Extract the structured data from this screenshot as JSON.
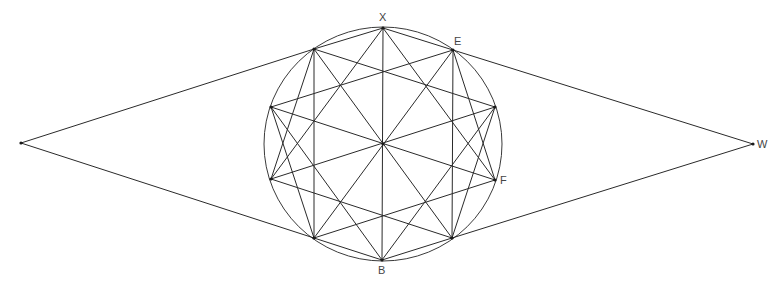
{
  "diagram": {
    "title": "",
    "colors": {
      "line": "#2a2a2a",
      "circle": "#3a3a3a",
      "label": "#444444",
      "background": "#ffffff"
    },
    "circle": {
      "cx": 383,
      "cy": 144,
      "rx": 119,
      "ry": 117
    },
    "points": {
      "X": {
        "x": 383,
        "y": 28,
        "label": "X"
      },
      "E": {
        "x": 453,
        "y": 50,
        "label": "E"
      },
      "RT": {
        "x": 495,
        "y": 107,
        "label": ""
      },
      "F": {
        "x": 495,
        "y": 180,
        "label": "F"
      },
      "LR": {
        "x": 452,
        "y": 238,
        "label": ""
      },
      "B": {
        "x": 382,
        "y": 260,
        "label": "B"
      },
      "LL": {
        "x": 314,
        "y": 238,
        "label": ""
      },
      "LB": {
        "x": 271,
        "y": 179,
        "label": ""
      },
      "LT": {
        "x": 271,
        "y": 107,
        "label": ""
      },
      "UL": {
        "x": 314,
        "y": 49,
        "label": ""
      },
      "C": {
        "x": 383,
        "y": 144,
        "label": ""
      },
      "L": {
        "x": 21,
        "y": 143,
        "label": ""
      },
      "W": {
        "x": 753,
        "y": 144,
        "label": "W"
      }
    },
    "labels": [
      {
        "text": "X",
        "x": 379,
        "y": 12
      },
      {
        "text": "E",
        "x": 454,
        "y": 36
      },
      {
        "text": "F",
        "x": 500,
        "y": 175
      },
      {
        "text": "B",
        "x": 378,
        "y": 265
      },
      {
        "text": "W",
        "x": 757,
        "y": 139
      }
    ],
    "segments": [
      [
        "L",
        "UL"
      ],
      [
        "L",
        "LL"
      ],
      [
        "W",
        "E"
      ],
      [
        "W",
        "LR"
      ],
      [
        "X",
        "B"
      ],
      [
        "UL",
        "LL"
      ],
      [
        "E",
        "LR"
      ],
      [
        "X",
        "UL"
      ],
      [
        "X",
        "E"
      ],
      [
        "B",
        "LL"
      ],
      [
        "B",
        "LR"
      ],
      [
        "X",
        "LB"
      ],
      [
        "X",
        "F"
      ],
      [
        "B",
        "LT"
      ],
      [
        "B",
        "RT"
      ],
      [
        "UL",
        "RT"
      ],
      [
        "LT",
        "E"
      ],
      [
        "LB",
        "LR"
      ],
      [
        "LL",
        "F"
      ],
      [
        "LT",
        "F"
      ],
      [
        "LB",
        "RT"
      ],
      [
        "UL",
        "LR"
      ],
      [
        "E",
        "LL"
      ],
      [
        "LT",
        "LL"
      ],
      [
        "LB",
        "UL"
      ],
      [
        "RT",
        "LR"
      ],
      [
        "F",
        "E"
      ]
    ],
    "vertices_marked": [
      "X",
      "E",
      "RT",
      "F",
      "LR",
      "B",
      "LL",
      "LB",
      "LT",
      "UL",
      "C",
      "L",
      "W"
    ]
  }
}
